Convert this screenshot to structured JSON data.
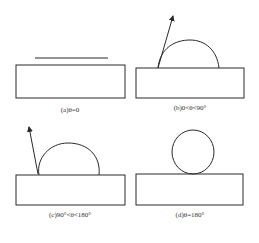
{
  "panels": [
    {
      "id": "a",
      "caption": "(a)θ=0",
      "description": "flat film on substrate"
    },
    {
      "id": "b",
      "caption": "(b)0<θ<90°",
      "description": "low dome droplet with contact angle arrow"
    },
    {
      "id": "c",
      "caption": "(c)90°<θ<180°",
      "description": "high dome droplet with contact angle arrow"
    },
    {
      "id": "d",
      "caption": "(d)θ=180°",
      "description": "spherical droplet touching substrate"
    }
  ],
  "colors": {
    "stroke": "#2a2a2a",
    "background": "#ffffff"
  }
}
